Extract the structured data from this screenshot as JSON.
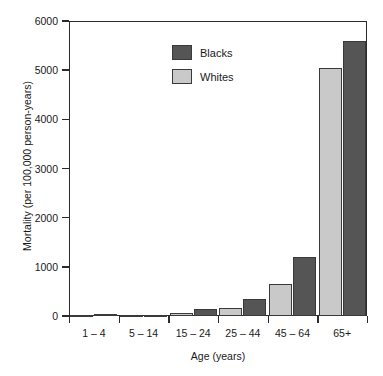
{
  "chart_data": {
    "type": "bar",
    "title": "",
    "xlabel": "Age (years)",
    "ylabel": "Mortality (per 100,000 person-years)",
    "categories": [
      "1 – 4",
      "5 – 14",
      "15 – 24",
      "25 – 44",
      "45 – 64",
      "65+"
    ],
    "series": [
      {
        "name": "Whites",
        "color": "#c9c9c9",
        "values": [
          20,
          12,
          65,
          155,
          650,
          5050
        ]
      },
      {
        "name": "Blacks",
        "color": "#555555",
        "values": [
          45,
          20,
          140,
          340,
          1200,
          5600
        ]
      }
    ],
    "ylim": [
      0,
      6000
    ],
    "yticks": [
      0,
      1000,
      2000,
      3000,
      4000,
      5000,
      6000
    ],
    "ytick_labels": [
      "0",
      "1000",
      "2000",
      "3000",
      "4000",
      "5000",
      "6000"
    ],
    "grid": false,
    "legend_position": "upper-center",
    "legend_entries": [
      "Blacks",
      "Whites"
    ],
    "frame": true,
    "series_order_in_group": [
      "Whites",
      "Blacks"
    ]
  }
}
